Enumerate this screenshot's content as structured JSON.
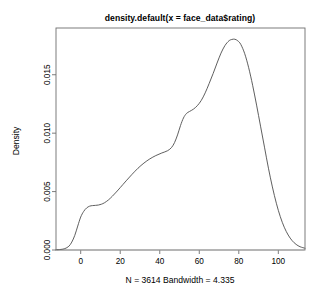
{
  "chart_data": {
    "type": "line",
    "title": "density.default(x = face_data$rating)",
    "subtitle": "N = 3614   Bandwidth = 4.335",
    "xlabel": "",
    "ylabel": "Density",
    "grid": false,
    "legend": "none",
    "n": 3614,
    "bandwidth": 4.335,
    "xlim": [
      -12.5,
      113.5
    ],
    "ylim": [
      0.0,
      0.019
    ],
    "xticks": [
      0,
      20,
      40,
      60,
      80,
      100
    ],
    "xtick_labels": [
      "0",
      "20",
      "40",
      "60",
      "80",
      "100"
    ],
    "yticks": [
      0.0,
      0.005,
      0.01,
      0.015
    ],
    "ytick_labels": [
      "0.000",
      "0.005",
      "0.010",
      "0.015"
    ],
    "series": [
      {
        "name": "density",
        "x": [
          -12.5,
          -10.0,
          -8.0,
          -6.0,
          -4.5,
          -3.0,
          -1.5,
          0.0,
          1.5,
          3.0,
          4.5,
          6.0,
          7.5,
          9.0,
          10.5,
          12.0,
          14.0,
          16.0,
          18.0,
          20.0,
          23.0,
          26.0,
          29.0,
          32.0,
          35.0,
          38.0,
          41.0,
          44.0,
          46.0,
          47.5,
          49.0,
          50.5,
          52.0,
          53.5,
          55.0,
          57.0,
          59.0,
          61.0,
          63.0,
          65.0,
          67.0,
          69.0,
          71.0,
          73.0,
          75.0,
          76.5,
          78.0,
          79.5,
          81.0,
          83.0,
          85.0,
          87.0,
          89.0,
          91.0,
          93.0,
          95.0,
          97.0,
          99.0,
          101.0,
          103.0,
          105.0,
          107.0,
          109.0,
          111.0,
          113.5
        ],
        "y": [
          2e-05,
          5e-05,
          0.00012,
          0.00032,
          0.00068,
          0.00125,
          0.00205,
          0.00282,
          0.0033,
          0.0036,
          0.00375,
          0.0038,
          0.00382,
          0.00385,
          0.00392,
          0.00404,
          0.00428,
          0.0046,
          0.00496,
          0.00534,
          0.00592,
          0.00648,
          0.007,
          0.00744,
          0.0078,
          0.00808,
          0.0083,
          0.0085,
          0.00878,
          0.0092,
          0.00985,
          0.01065,
          0.0113,
          0.01168,
          0.01185,
          0.01205,
          0.01235,
          0.0128,
          0.01345,
          0.01425,
          0.0151,
          0.016,
          0.01685,
          0.0175,
          0.0179,
          0.01802,
          0.01804,
          0.0179,
          0.0176,
          0.0168,
          0.0156,
          0.0141,
          0.0124,
          0.0106,
          0.0088,
          0.007,
          0.0054,
          0.004,
          0.00285,
          0.00195,
          0.00128,
          0.0008,
          0.00048,
          0.00028,
          0.00015
        ]
      }
    ]
  },
  "geometry": {
    "plot_left": 56,
    "plot_right": 305,
    "plot_top": 28,
    "plot_bottom": 250,
    "title_x": 180,
    "title_y": 21,
    "caption_x": 180,
    "caption_y": 283,
    "ylabel_x": 19,
    "ylabel_y": 141
  }
}
